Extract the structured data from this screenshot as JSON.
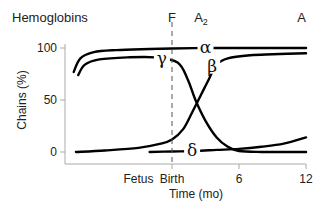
{
  "chart_data": {
    "type": "line",
    "title": "Hemoglobins",
    "xlabel": "Time (mo)",
    "ylabel": "Chains (%)",
    "ylim": [
      0,
      100
    ],
    "yticks": [
      0,
      50,
      100
    ],
    "xticks": [
      {
        "label": "Fetus",
        "x": -3,
        "tick": false
      },
      {
        "label": "Birth",
        "x": 0,
        "tick": true
      },
      {
        "label": "6",
        "x": 6,
        "tick": true
      },
      {
        "label": "12",
        "x": 12,
        "tick": true
      }
    ],
    "xlim": [
      -9,
      12
    ],
    "grid": false,
    "legend": "inline-labels",
    "birth_marker": {
      "x": 0,
      "style": "dashed"
    },
    "hemoglobin_labels": [
      {
        "label": "F",
        "x": 0
      },
      {
        "label": "A₂",
        "x": 2.6
      },
      {
        "label": "A",
        "x": 11.6
      }
    ],
    "series": [
      {
        "name": "α",
        "label_at": {
          "x": 3.0,
          "y": 100
        },
        "points": [
          [
            -8.8,
            77
          ],
          [
            -8.2,
            90
          ],
          [
            -7.0,
            96
          ],
          [
            -5,
            98
          ],
          [
            -2,
            99
          ],
          [
            0,
            99.5
          ],
          [
            3,
            100
          ],
          [
            6,
            100
          ],
          [
            9,
            100
          ],
          [
            12,
            100
          ]
        ]
      },
      {
        "name": "γ",
        "label_at": {
          "x": -0.9,
          "y": 89
        },
        "points": [
          [
            -8.4,
            74
          ],
          [
            -7.8,
            84
          ],
          [
            -6.5,
            89
          ],
          [
            -4,
            91
          ],
          [
            -1.5,
            91
          ],
          [
            0.5,
            86
          ],
          [
            1.4,
            70
          ],
          [
            2.1,
            50
          ],
          [
            3.0,
            30
          ],
          [
            4.0,
            14
          ],
          [
            5.0,
            5
          ],
          [
            6.0,
            1
          ],
          [
            8,
            0
          ],
          [
            10,
            0
          ],
          [
            12,
            0
          ]
        ]
      },
      {
        "name": "β",
        "label_at": {
          "x": 3.6,
          "y": 82
        },
        "points": [
          [
            -8.6,
            0
          ],
          [
            -6,
            1.5
          ],
          [
            -3,
            4
          ],
          [
            -1,
            8
          ],
          [
            0,
            12
          ],
          [
            1,
            22
          ],
          [
            1.8,
            38
          ],
          [
            2.6,
            55
          ],
          [
            3.3,
            70
          ],
          [
            4,
            84
          ],
          [
            5,
            90
          ],
          [
            7,
            93
          ],
          [
            9,
            94
          ],
          [
            12,
            95
          ]
        ]
      },
      {
        "name": "δ",
        "label_at": {
          "x": 1.8,
          "y": 1
        },
        "points": [
          [
            -2,
            0
          ],
          [
            0,
            0.5
          ],
          [
            2,
            1
          ],
          [
            4,
            2
          ],
          [
            6,
            3
          ],
          [
            8,
            5
          ],
          [
            10,
            8
          ],
          [
            12,
            14
          ]
        ]
      }
    ]
  }
}
